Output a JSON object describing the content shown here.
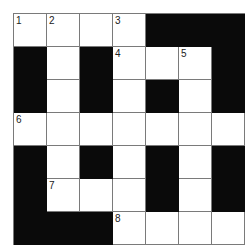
{
  "puzzle": {
    "rows": 7,
    "cols": 7,
    "grid": [
      [
        "1",
        "2",
        "",
        "3",
        "#",
        "#",
        "#"
      ],
      [
        "#",
        "",
        "#",
        "4",
        "",
        "5",
        "#"
      ],
      [
        "#",
        "",
        "#",
        "",
        "#",
        "",
        "#"
      ],
      [
        "6",
        "",
        "",
        "",
        "",
        "",
        ""
      ],
      [
        "#",
        "",
        "#",
        "",
        "#",
        "",
        "#"
      ],
      [
        "#",
        "7",
        "",
        "",
        "#",
        "",
        "#"
      ],
      [
        "#",
        "#",
        "#",
        "8",
        "",
        "",
        ""
      ]
    ],
    "colors": {
      "block": "#0a0a0a",
      "cell": "#ffffff",
      "line": "#7a7a7a"
    }
  }
}
